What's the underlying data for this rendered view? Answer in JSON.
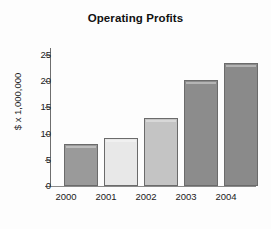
{
  "chart_data": {
    "type": "bar",
    "title": "Operating Profits",
    "xlabel": "",
    "ylabel": "$ x 1,000,000",
    "categories": [
      "2000",
      "2001",
      "2002",
      "2003",
      "2004"
    ],
    "values": [
      8,
      9.2,
      13,
      20.2,
      23.4
    ],
    "ylim": [
      0,
      25
    ],
    "yticks": [
      0,
      5,
      10,
      15,
      20,
      25
    ],
    "ytick_labels": [
      "0",
      "5",
      "10",
      "15",
      "20",
      "25"
    ],
    "grid": false,
    "legend": "none",
    "bar_colors": [
      "#9a9a9a",
      "#e8e8e8",
      "#c4c4c4",
      "#8c8c8c",
      "#8a8a8a"
    ],
    "bar_edge_color": "#6b6b6b",
    "background_color": "#fdfdfd",
    "text_color": "#1a1a1a",
    "axis_color": "#6e6e6e"
  }
}
